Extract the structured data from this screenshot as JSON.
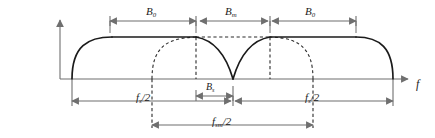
{
  "figure": {
    "kind": "spectrum-diagram",
    "axis": {
      "x_label": "f",
      "x_label_name": "frequency-axis-label",
      "y_axis_present": true
    },
    "colors": {
      "curve": "#1b1b1b",
      "axis": "#6f6f6f",
      "dimension": "#6f6f6f",
      "dashed": "#2b2b2b",
      "background": "#ffffff"
    },
    "top_dimensions": [
      {
        "id": "b0-left",
        "symbol": "B",
        "subscript": "0",
        "x_start": 110,
        "x_end": 196
      },
      {
        "id": "bm",
        "symbol": "B",
        "subscript": "m",
        "x_start": 200,
        "x_end": 268
      },
      {
        "id": "b0-right",
        "symbol": "B",
        "subscript": "0",
        "x_start": 272,
        "x_end": 356
      }
    ],
    "middle_dimension": {
      "id": "bs",
      "symbol": "B",
      "subscript": "s",
      "x_start": 196,
      "x_end": 233
    },
    "bottom_dimensions": [
      {
        "id": "fs-left",
        "symbol": "f",
        "subscript": "s",
        "divisor": "/2",
        "x_start": 72,
        "x_end": 233
      },
      {
        "id": "fs-right",
        "symbol": "f",
        "subscript": "s",
        "divisor": "/2",
        "x_start": 233,
        "x_end": 393
      }
    ],
    "lower_dimension": {
      "id": "fsm",
      "symbol": "f",
      "subscript": "sm",
      "divisor": "/2",
      "x_start": 152,
      "x_end": 313
    },
    "labels": {
      "b0_left": "B",
      "b0_left_sub": "0",
      "bm": "B",
      "bm_sub": "m",
      "b0_right": "B",
      "b0_right_sub": "0",
      "bs": "B",
      "bs_sub": "s",
      "fs_left": "f",
      "fs_left_sub": "s",
      "fs_left_div": "/2",
      "fs_right": "f",
      "fs_right_sub": "s",
      "fs_right_div": "/2",
      "fsm": "f",
      "fsm_sub": "sm",
      "fsm_div": "/2",
      "axis_f": "f"
    }
  }
}
